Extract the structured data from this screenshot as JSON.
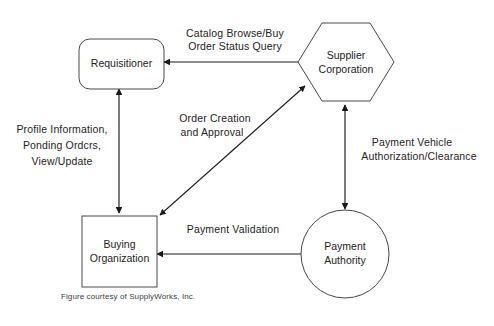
{
  "diagram": {
    "type": "flow-diagram",
    "background_color": "#ffffff",
    "node_stroke_color": "#44484d",
    "edge_color": "#1a1a1a",
    "text_color": "#1f2326",
    "nodes": [
      {
        "id": "requisitioner",
        "label_line1": "Requisitioner",
        "label_line2": "",
        "shape": "rounded-rectangle"
      },
      {
        "id": "supplier-corporation",
        "label_line1": "Supplier",
        "label_line2": "Corporation",
        "shape": "hexagon"
      },
      {
        "id": "buying-organization",
        "label_line1": "Buying",
        "label_line2": "Organization",
        "shape": "rectangle"
      },
      {
        "id": "payment-authority",
        "label_line1": "Payment",
        "label_line2": "Authority",
        "shape": "circle"
      }
    ],
    "edges": [
      {
        "id": "requisitioner-supplier",
        "from": "requisitioner",
        "to": "supplier-corporation",
        "direction": "bidirectional",
        "orientation": "horizontal",
        "label_line1": "Catalog Browse/Buy",
        "label_line2": "Order Status Query"
      },
      {
        "id": "requisitioner-buying",
        "from": "requisitioner",
        "to": "buying-organization",
        "direction": "bidirectional",
        "orientation": "vertical",
        "label_line1": "Profile Information,",
        "label_line2": "Ponding Ordcrs,",
        "label_line3": "View/Update"
      },
      {
        "id": "buying-supplier",
        "from": "buying-organization",
        "to": "supplier-corporation",
        "direction": "bidirectional",
        "orientation": "diagonal",
        "label_line1": "Order Creation",
        "label_line2": "and Approval"
      },
      {
        "id": "supplier-payment",
        "from": "supplier-corporation",
        "to": "payment-authority",
        "direction": "bidirectional",
        "orientation": "vertical",
        "label_line1": "Payment Vehicle",
        "label_line2": "Authorization/Clearance"
      },
      {
        "id": "buying-payment",
        "from": "buying-organization",
        "to": "payment-authority",
        "direction": "bidirectional",
        "orientation": "horizontal",
        "label_line1": "Payment Validation"
      }
    ],
    "caption": "Figure courtesy of SupplyWorks, Inc."
  }
}
